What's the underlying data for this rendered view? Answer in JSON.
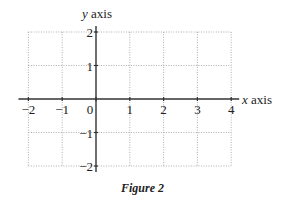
{
  "chart_data": {
    "type": "line",
    "title": "",
    "caption": "Figure 2",
    "xlabel": "x axis",
    "ylabel": "y axis",
    "xlim": [
      -2,
      4
    ],
    "ylim": [
      -2,
      2
    ],
    "x_ticks": [
      -2,
      -1,
      0,
      1,
      2,
      3,
      4
    ],
    "y_ticks": [
      -2,
      -1,
      1,
      2
    ],
    "x_tick_labels": [
      "−2",
      "−1",
      "0",
      "1",
      "2",
      "3",
      "4"
    ],
    "y_tick_labels": [
      "−2",
      "−1",
      "1",
      "2"
    ],
    "grid": true,
    "grid_style": "dotted",
    "series": [],
    "legend": null
  },
  "labels": {
    "x_axis_var": "x",
    "x_axis_word": "axis",
    "y_axis_var": "y",
    "y_axis_word": "axis",
    "caption": "Figure 2"
  },
  "colors": {
    "axis": "#333333",
    "grid": "#999999",
    "text": "#222222"
  }
}
